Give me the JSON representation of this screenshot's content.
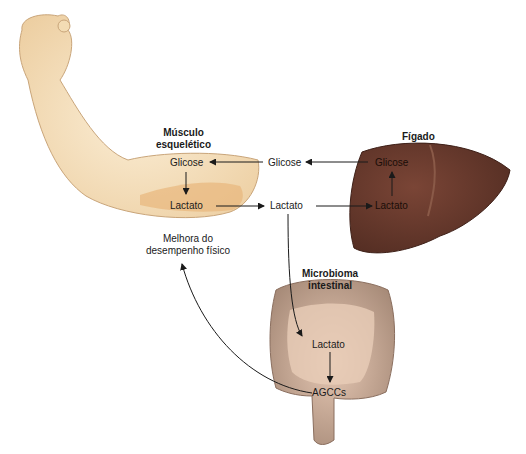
{
  "diagram": {
    "organs": {
      "muscle": {
        "title_line1": "Músculo",
        "title_line2": "esquelético",
        "glucose": "Glicose",
        "lactate": "Lactato"
      },
      "liver": {
        "title": "Fígado",
        "glucose": "Glicose",
        "lactate": "Lactato"
      },
      "gut": {
        "title_line1": "Microbioma",
        "title_line2": "intestinal",
        "lactate": "Lactato",
        "scfa": "AGCCs"
      }
    },
    "blood": {
      "glucose": "Glicose",
      "lactate": "Lactato"
    },
    "outcome": {
      "line1": "Melhora do",
      "line2": "desempenho físico"
    },
    "colors": {
      "skin": "#f3dcb4",
      "muscle_shade": "#e8b77c",
      "liver": "#6b3a2e",
      "gut": "#b89a88",
      "arrow": "#1a1a1a"
    }
  }
}
